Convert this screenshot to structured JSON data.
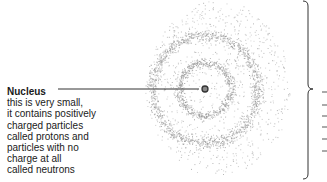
{
  "diagram": {
    "nucleus_label": {
      "title": "Nucleus",
      "lines": [
        "this is very small,",
        "it contains positively",
        "charged particles",
        "called protons and",
        "particles with no",
        "charge at all",
        "called neutrons"
      ]
    },
    "nucleus": {
      "cx": 205,
      "cy": 89,
      "r": 3
    },
    "rings": [
      {
        "name": "inner-shell",
        "r": 26,
        "band": 6
      },
      {
        "name": "outer-shell",
        "r": 53,
        "band": 8
      }
    ],
    "cloud": {
      "cx": 218,
      "cy": 88,
      "rx": 72,
      "ry": 88
    },
    "colors": {
      "dots": "#9a9a9a",
      "line": "#333333",
      "text": "#1a1a1a"
    },
    "brace": {
      "x": 308,
      "top": 1,
      "bottom": 179,
      "tip_y": 89
    }
  }
}
